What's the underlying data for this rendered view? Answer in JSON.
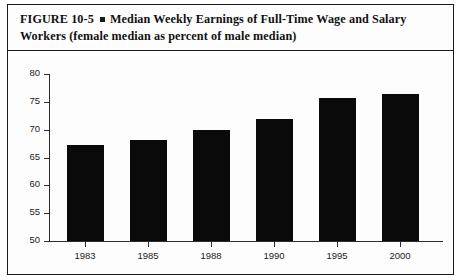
{
  "figure": {
    "label": "FIGURE  10-5",
    "bullet": "square-bullet",
    "title_line1": "Median Weekly Earnings of Full-Time Wage and Salary",
    "title_line2": "Workers (female median as percent of male median)"
  },
  "chart_data": {
    "type": "bar",
    "title": "Median Weekly Earnings of Full-Time Wage and Salary Workers (female median as percent of male median)",
    "xlabel": "",
    "ylabel": "",
    "categories": [
      "1983",
      "1985",
      "1988",
      "1990",
      "1995",
      "2000"
    ],
    "values": [
      67.2,
      68.2,
      70.0,
      72.0,
      75.7,
      76.5
    ],
    "ylim": [
      50,
      80
    ],
    "yticks": [
      50,
      55,
      60,
      65,
      70,
      75,
      80
    ],
    "ytick_labels": [
      "50",
      "55",
      "60",
      "65",
      "70",
      "75",
      "80"
    ],
    "grid": false,
    "legend": "none",
    "bar_color": "#0a0a0a"
  },
  "colors": {
    "bar": "#0a0a0a",
    "axis": "#2b2b2b",
    "border": "#1a1a1a",
    "text": "#111111",
    "background": "#fdfdfd"
  }
}
